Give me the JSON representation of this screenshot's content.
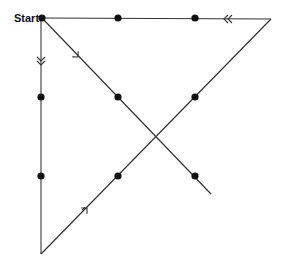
{
  "diagram": {
    "start_label": "Start",
    "dots": [
      {
        "id": "r1c1",
        "x": 42,
        "y": 18
      },
      {
        "id": "r1c2",
        "x": 118,
        "y": 18
      },
      {
        "id": "r1c3",
        "x": 195,
        "y": 18
      },
      {
        "id": "r2c1",
        "x": 41,
        "y": 97
      },
      {
        "id": "r2c2",
        "x": 118,
        "y": 97
      },
      {
        "id": "r2c3",
        "x": 195,
        "y": 97
      },
      {
        "id": "r3c1",
        "x": 41,
        "y": 176
      },
      {
        "id": "r3c2",
        "x": 118,
        "y": 176
      },
      {
        "id": "r3c3",
        "x": 195,
        "y": 176
      }
    ],
    "path": [
      {
        "step": 1,
        "from": [
          42,
          18
        ],
        "to": [
          211,
          194
        ],
        "arrow": "single",
        "direction": "down-right"
      },
      {
        "step": 2,
        "from": [
          41,
          18
        ],
        "to": [
          41,
          254
        ],
        "arrow": "double",
        "direction": "down"
      },
      {
        "step": 3,
        "from": [
          41,
          254
        ],
        "to": [
          271,
          19
        ],
        "arrow": "double-open",
        "direction": "up-right"
      },
      {
        "step": 4,
        "from": [
          271,
          19
        ],
        "to": [
          42,
          18
        ],
        "arrow": "double",
        "direction": "left"
      }
    ],
    "colors": {
      "line": "#333333",
      "dot": "#111111",
      "background": "#ffffff"
    }
  }
}
